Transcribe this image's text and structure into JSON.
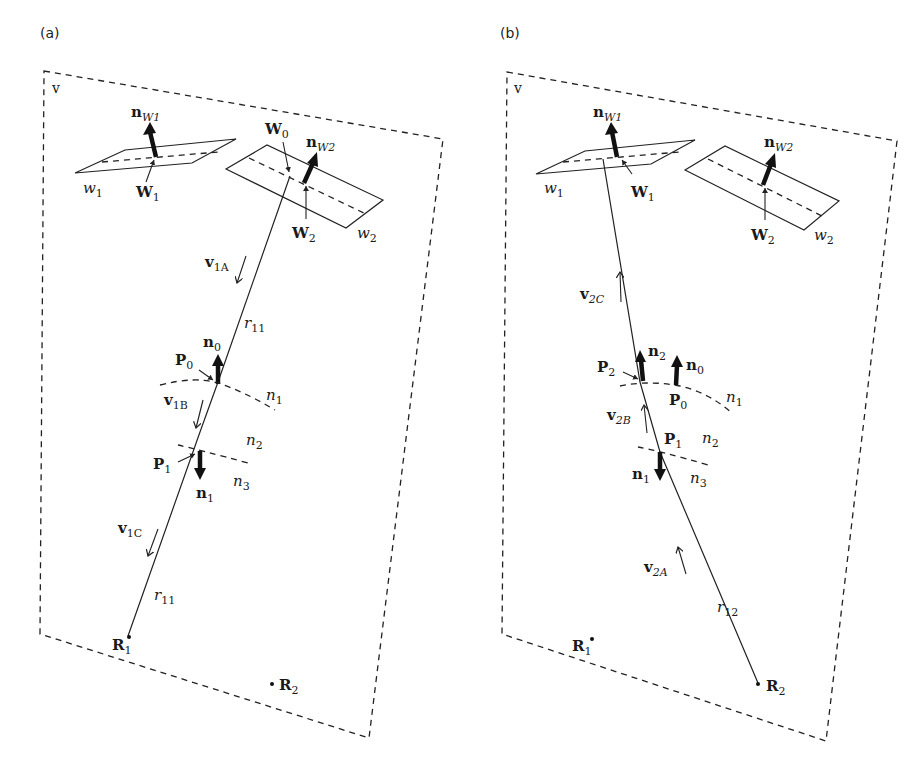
{
  "figure": {
    "panels": [
      {
        "tag": "(a)",
        "region_label": "v",
        "planes": [
          {
            "name": "w",
            "sub": "1",
            "point": "W",
            "point_sub": "1",
            "normal": "n",
            "normal_sub": "W1"
          },
          {
            "name": "w",
            "sub": "2",
            "point": "W",
            "point_sub": "2",
            "normal": "n",
            "normal_sub": "W2"
          }
        ],
        "extra_point": {
          "name": "W",
          "sub": "0"
        },
        "interface_points": [
          {
            "name": "P",
            "sub": "0",
            "normal": "n",
            "normal_sub": "0",
            "normal_dir": "up"
          },
          {
            "name": "P",
            "sub": "1",
            "normal": "n",
            "normal_sub": "1",
            "normal_dir": "down"
          }
        ],
        "media": [
          {
            "name": "n",
            "sub": "1"
          },
          {
            "name": "n",
            "sub": "2"
          },
          {
            "name": "n",
            "sub": "3"
          }
        ],
        "velocities": [
          {
            "name": "v",
            "sub": "1A",
            "dir": "down"
          },
          {
            "name": "v",
            "sub": "1B",
            "dir": "down"
          },
          {
            "name": "v",
            "sub": "1C",
            "dir": "down"
          }
        ],
        "ray_labels": [
          {
            "name": "r",
            "sub": "11"
          },
          {
            "name": "r",
            "sub": "11"
          }
        ],
        "receivers": [
          {
            "name": "R",
            "sub": "1"
          },
          {
            "name": "R",
            "sub": "2"
          }
        ]
      },
      {
        "tag": "(b)",
        "region_label": "v",
        "planes": [
          {
            "name": "w",
            "sub": "1",
            "point": "W",
            "point_sub": "1",
            "normal": "n",
            "normal_sub": "W1"
          },
          {
            "name": "w",
            "sub": "2",
            "point": "W",
            "point_sub": "2",
            "normal": "n",
            "normal_sub": "W2"
          }
        ],
        "interface_points": [
          {
            "name": "P",
            "sub": "2",
            "normal": "n",
            "normal_sub": "2",
            "normal_dir": "up"
          },
          {
            "name": "P",
            "sub": "0",
            "normal": "n",
            "normal_sub": "0",
            "normal_dir": "up"
          },
          {
            "name": "P",
            "sub": "1",
            "normal": "n",
            "normal_sub": "1",
            "normal_dir": "down"
          }
        ],
        "media": [
          {
            "name": "n",
            "sub": "1"
          },
          {
            "name": "n",
            "sub": "2"
          },
          {
            "name": "n",
            "sub": "3"
          }
        ],
        "velocities": [
          {
            "name": "v",
            "sub": "2C",
            "dir": "up"
          },
          {
            "name": "v",
            "sub": "2B",
            "dir": "up"
          },
          {
            "name": "v",
            "sub": "2A",
            "dir": "up"
          }
        ],
        "ray_labels": [
          {
            "name": "r",
            "sub": "12"
          }
        ],
        "receivers": [
          {
            "name": "R",
            "sub": "1"
          },
          {
            "name": "R",
            "sub": "2"
          }
        ]
      }
    ]
  }
}
